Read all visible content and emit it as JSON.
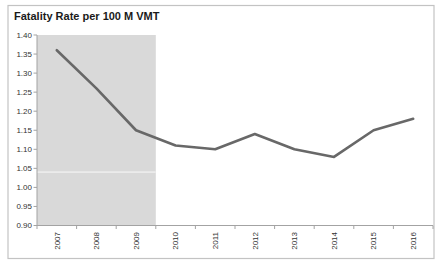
{
  "chart_data": {
    "type": "line",
    "title": "Fatality Rate per 100 M VMT",
    "categories": [
      "2007",
      "2008",
      "2009",
      "2010",
      "2011",
      "2012",
      "2013",
      "2014",
      "2015",
      "2016"
    ],
    "values": [
      1.36,
      1.26,
      1.15,
      1.11,
      1.1,
      1.14,
      1.1,
      1.08,
      1.15,
      1.18
    ],
    "xlabel": "",
    "ylabel": "",
    "ylim": [
      0.9,
      1.4
    ],
    "ytick_step": 0.05,
    "ytick_labels": [
      "1.40",
      "1.35",
      "1.30",
      "1.25",
      "1.20",
      "1.15",
      "1.10",
      "1.05",
      "1.00",
      "0.95",
      "0.90"
    ],
    "grid": false,
    "legend": false,
    "shaded_region": {
      "covers_categories": [
        "2007",
        "2008",
        "2009"
      ],
      "from_boundary_index": 0,
      "to_boundary_index": 3,
      "divider_value": 1.04
    }
  },
  "colors": {
    "line": "#686868",
    "shade": "#d9d9d9",
    "shade_divider": "#ebebeb",
    "axis": "#a3a3a3",
    "tick_label": "#333333",
    "title": "#1a1a1a",
    "frame_border": "#c3c3c3",
    "background": "#ffffff"
  }
}
